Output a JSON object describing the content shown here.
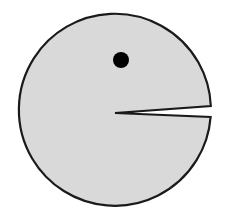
{
  "diagram": {
    "shape": "pac-man figure",
    "colors": {
      "background": "#ffffff",
      "body_fill": "#d9d9d9",
      "outline": "#1a1a1a",
      "eye": "#000000"
    },
    "body": {
      "cx": 115,
      "cy": 111,
      "r": 96
    },
    "mouth": {
      "apex_x": 115,
      "apex_y": 113,
      "upper_y": 106,
      "lower_y": 117,
      "right_x": 210
    },
    "eye": {
      "cx": 121,
      "cy": 60,
      "r": 8
    }
  }
}
